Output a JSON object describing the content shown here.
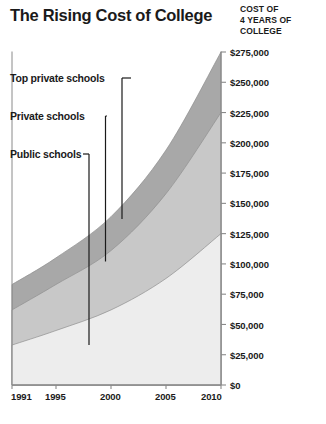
{
  "chart_data": {
    "type": "area",
    "title": "The Rising Cost of College",
    "subtitle": "",
    "ylabel": "COST OF\n4 YEARS OF\nCOLLEGE",
    "ylabel_lines": [
      "COST OF",
      "4 YEARS OF",
      "COLLEGE"
    ],
    "xlabel": "",
    "stacked": false,
    "grid": false,
    "legend_position": "inline-annotations",
    "xlim": [
      1991,
      2010
    ],
    "ylim": [
      0,
      275000
    ],
    "x_ticks": [
      1991,
      1995,
      2000,
      2005,
      2010
    ],
    "x_tick_labels": [
      "1991",
      "1995",
      "2000",
      "2005",
      "2010"
    ],
    "y_ticks": [
      0,
      25000,
      50000,
      75000,
      100000,
      125000,
      150000,
      175000,
      200000,
      225000,
      250000,
      275000
    ],
    "y_tick_labels": [
      "$0",
      "$25,000",
      "$50,000",
      "$75,000",
      "$100,000",
      "$125,000",
      "$150,000",
      "$175,000",
      "$200,000",
      "$225,000",
      "$250,000",
      "$275,000"
    ],
    "x": [
      1991,
      1995,
      2000,
      2005,
      2010
    ],
    "series": [
      {
        "name": "Public schools",
        "color": "#ededed",
        "values": [
          33000,
          45000,
          62000,
          88000,
          125000
        ]
      },
      {
        "name": "Private schools",
        "color": "#c8c8c8",
        "values": [
          62000,
          83000,
          111000,
          158000,
          225000
        ]
      },
      {
        "name": "Top private schools",
        "color": "#a8a8a8",
        "values": [
          83000,
          105000,
          139000,
          194000,
          275000
        ]
      }
    ],
    "annotations": [
      {
        "text": "Top private schools",
        "points_to_year": 2001,
        "points_to_value": 137000
      },
      {
        "text": "Private schools",
        "points_to_year": 1999.5,
        "points_to_value": 102000
      },
      {
        "text": "Public schools",
        "points_to_year": 1998,
        "points_to_value": 33000
      }
    ]
  },
  "colors": {
    "band_top": "#a8a8a8",
    "band_mid": "#c8c8c8",
    "band_bottom": "#ededed",
    "axis": "#8a8a8a",
    "text": "#1a1a1a",
    "leader": "#1a1a1a",
    "background": "#ffffff"
  }
}
